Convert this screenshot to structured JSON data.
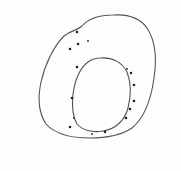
{
  "diagram": {
    "title": "",
    "colors": {
      "stroke": "#555555",
      "dot": "#222222",
      "background": "#fdfdfd"
    },
    "outer_boundary": {
      "path": "M 113 15 C 128 14 140 18 147 28 C 155 40 157 58 154 78 C 151 100 144 118 132 128 C 120 136 104 138 90 138 C 72 138 55 134 46 124 C 38 112 38 96 41 82 C 45 64 54 46 64 36 C 72 30 78 30 82 26 C 90 17 101 15 113 15 Z"
    },
    "inner_ring": {
      "path": "M 100 58 C 112 57 122 62 127 72 C 131 82 131 96 128 108 C 125 120 116 129 103 131 C 92 133 82 130 77 124 C 72 116 72 104 73 94 C 75 80 80 68 88 62 C 92 59 96 58 100 58 Z"
    },
    "dots": [
      {
        "x": 77,
        "y": 32,
        "r": 1.3
      },
      {
        "x": 78,
        "y": 44,
        "r": 1.3
      },
      {
        "x": 88,
        "y": 41,
        "r": 0.9
      },
      {
        "x": 70,
        "y": 49,
        "r": 1.3
      },
      {
        "x": 77,
        "y": 67,
        "r": 1.3
      },
      {
        "x": 72,
        "y": 98,
        "r": 1.3
      },
      {
        "x": 74,
        "y": 118,
        "r": 0.9
      },
      {
        "x": 70,
        "y": 127,
        "r": 1.3
      },
      {
        "x": 92,
        "y": 134,
        "r": 0.9
      },
      {
        "x": 105,
        "y": 132,
        "r": 1.3
      },
      {
        "x": 127,
        "y": 69,
        "r": 0.9
      },
      {
        "x": 131,
        "y": 73,
        "r": 1.3
      },
      {
        "x": 134,
        "y": 85,
        "r": 1.3
      },
      {
        "x": 134,
        "y": 101,
        "r": 1.3
      },
      {
        "x": 130,
        "y": 109,
        "r": 1.3
      },
      {
        "x": 126,
        "y": 118,
        "r": 1.3
      }
    ]
  }
}
